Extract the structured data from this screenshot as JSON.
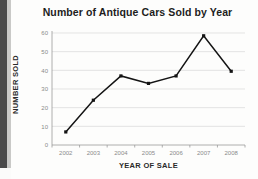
{
  "chart_data": {
    "type": "line",
    "title": "Number of Antique Cars Sold by Year",
    "xlabel": "YEAR OF SALE",
    "ylabel": "NUMBER SOLD",
    "categories": [
      "2002",
      "2003",
      "2004",
      "2005",
      "2006",
      "2007",
      "2008"
    ],
    "values": [
      7,
      24,
      37,
      33,
      37,
      58.5,
      39.5
    ],
    "ylim": [
      0,
      60
    ],
    "yticks": [
      0,
      10,
      20,
      30,
      40,
      50,
      60
    ],
    "ytick_labels": [
      "0",
      "10",
      "20",
      "30",
      "40",
      "50",
      "60"
    ],
    "grid": true,
    "legend": false,
    "legend_position": "none",
    "line_color": "#141414",
    "marker": "square",
    "grid_color": "#d8d8d8",
    "axis_color": "#9a9a9a",
    "tick_label_color": "#8a8a8a"
  },
  "page": {
    "background_color": "#fdfdfc",
    "scan_edge_color": "#4a4a4a",
    "scan_edge_light_color": "#c9c9c7"
  }
}
